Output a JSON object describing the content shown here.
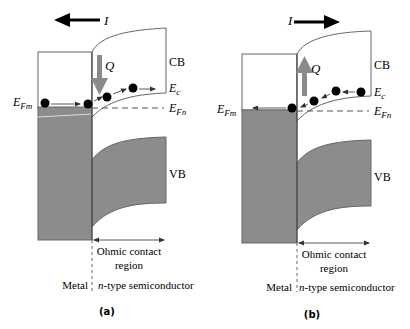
{
  "figure": {
    "panels": [
      {
        "id": "a",
        "caption": "(a)",
        "current_label": "I",
        "current_direction": "left",
        "heat_label": "Q",
        "heat_direction": "down",
        "labels": {
          "cb": "CB",
          "vb": "VB",
          "ec": "E",
          "ec_sub": "c",
          "efn": "E",
          "efn_sub": "Fn",
          "efm": "E",
          "efm_sub": "Fm",
          "ohmic_line1": "Ohmic contact",
          "ohmic_line2": "region",
          "metal": "Metal",
          "semiconductor_italic": "n",
          "semiconductor_rest": "-type semiconductor"
        }
      },
      {
        "id": "b",
        "caption": "(b)",
        "current_label": "I",
        "current_direction": "right",
        "heat_label": "Q",
        "heat_direction": "up",
        "labels": {
          "cb": "CB",
          "vb": "VB",
          "ec": "E",
          "ec_sub": "c",
          "efn": "E",
          "efn_sub": "Fn",
          "efm": "E",
          "efm_sub": "Fm",
          "ohmic_line1": "Ohmic contact",
          "ohmic_line2": "region",
          "metal": "Metal",
          "semiconductor_italic": "n",
          "semiconductor_rest": "-type semiconductor"
        }
      }
    ],
    "colors": {
      "band_fill": "#8c8c8c",
      "heat_arrow": "#8a8a8a",
      "line": "#555555",
      "electron": "#000000"
    }
  }
}
